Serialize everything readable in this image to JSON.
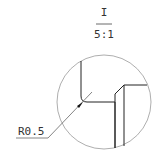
{
  "view_label": {
    "id": "I",
    "scale": "5:1"
  },
  "dimension": {
    "radius": "R0.5"
  },
  "colors": {
    "line": "#222222",
    "circle": "#999999",
    "text": "#333333"
  }
}
